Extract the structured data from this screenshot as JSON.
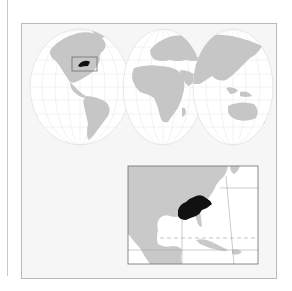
{
  "map": {
    "type": "locator-map",
    "world_projection": "interrupted-three-lobe",
    "highlighted_region": "southeastern-united-states",
    "inset": {
      "region": "north-america-gulf-of-mexico-caribbean",
      "dashed_line": "tropic-of-cancer"
    },
    "colors": {
      "land": "#c9c9c9",
      "ocean": "#ffffff",
      "highlight": "#111111",
      "frame_fill": "#f6f6f6",
      "grid": "#d8d8d8",
      "border": "#8a8a8a"
    }
  }
}
